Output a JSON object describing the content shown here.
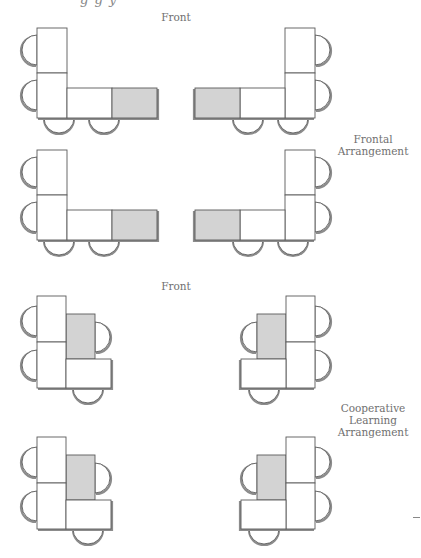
{
  "header": {
    "clipped_text": "g g y"
  },
  "frontal": {
    "front_label": "Front",
    "caption_line1": "Frontal",
    "caption_line2": "Arrangement"
  },
  "cooperative": {
    "front_label": "Front",
    "caption_line1": "Cooperative",
    "caption_line2": "Learning",
    "caption_line3": "Arrangement"
  },
  "colors": {
    "line": "#5a5a5a",
    "shadow": "#8c8c8c",
    "teacher_desk": "#d3d3d3",
    "student_desk": "#ffffff"
  }
}
